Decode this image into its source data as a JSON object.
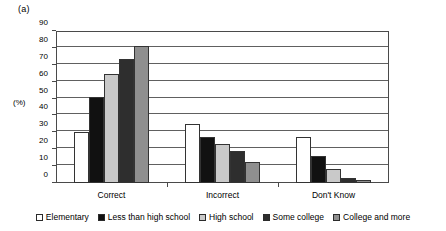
{
  "figure": {
    "panel_label": "(a)",
    "y_axis_title": "(%)"
  },
  "chart_data": {
    "type": "bar",
    "title": "",
    "subtitle": "",
    "xlabel": "",
    "ylabel": "(%)",
    "ylim": [
      0,
      90
    ],
    "ytick_values": [
      0,
      10,
      20,
      30,
      40,
      50,
      60,
      70,
      80,
      90
    ],
    "ytick_labels": [
      "0",
      "10",
      "20",
      "30",
      "40",
      "50",
      "60",
      "70",
      "80",
      "90"
    ],
    "grid": true,
    "legend_position": "bottom",
    "categories": [
      "Correct",
      "Incorrect",
      "Don't Know"
    ],
    "series": [
      {
        "name": "Elementary",
        "color": "#ffffff",
        "values": [
          30,
          35,
          27
        ]
      },
      {
        "name": "Less than high school",
        "color": "#111111",
        "values": [
          51,
          27.5,
          16
        ]
      },
      {
        "name": "High school",
        "color": "#c9c9c9",
        "values": [
          64.5,
          23,
          8.5
        ]
      },
      {
        "name": "Some college",
        "color": "#2e2e2e",
        "values": [
          73.5,
          19,
          2.8
        ]
      },
      {
        "name": "College and more",
        "color": "#8f8f8f",
        "values": [
          81,
          12.5,
          1.5
        ]
      }
    ]
  },
  "legend": {
    "items": [
      {
        "label": "Elementary",
        "color": "#ffffff"
      },
      {
        "label": "Less than high school",
        "color": "#111111"
      },
      {
        "label": "High school",
        "color": "#c9c9c9"
      },
      {
        "label": "Some college",
        "color": "#2e2e2e"
      },
      {
        "label": "College and more",
        "color": "#8f8f8f"
      }
    ]
  }
}
